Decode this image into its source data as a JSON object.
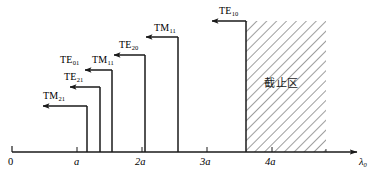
{
  "figure": {
    "title": "",
    "axis": {
      "name_symbol": "λ",
      "name_subscript": "0",
      "ticks": [
        {
          "label": "0",
          "italic": false,
          "x_units": 0
        },
        {
          "label": "a",
          "italic": true,
          "x_units": 1
        },
        {
          "label": "2a",
          "italic": true,
          "x_units": 2
        },
        {
          "label": "3a",
          "italic": true,
          "x_units": 3
        },
        {
          "label": "4a",
          "italic": true,
          "x_units": 4
        }
      ]
    },
    "region": {
      "label": "截止区",
      "start_units": 3.6,
      "end_units": 4.83,
      "hatch_color": "#4d4d4d",
      "fill_color": "#ffffff"
    },
    "modes": [
      {
        "name": "TM",
        "subscript": "21",
        "label": "TM₂₁",
        "cutoff_units": 1.12,
        "arrow_y": 106
      },
      {
        "name": "TE",
        "subscript": "21",
        "label": "TE₂₁",
        "cutoff_units": 1.35,
        "arrow_y": 87
      },
      {
        "name": "TE",
        "subscript": "01",
        "label": "TE₀₁",
        "cutoff_units": 1.55,
        "arrow_y": 70
      },
      {
        "name": "TM",
        "subscript": "11",
        "label": "TM₁₁",
        "cutoff_units": 1.55,
        "arrow_y": 70
      },
      {
        "name": "TE",
        "subscript": "20",
        "label": "TE₂₀",
        "cutoff_units": 2.05,
        "arrow_y": 55
      },
      {
        "name": "TM",
        "subscript": "11",
        "label": "TM₁₁",
        "cutoff_units": 2.55,
        "arrow_y": 37
      },
      {
        "name": "TE",
        "subscript": "10",
        "label": "TE₁₀",
        "cutoff_units": 3.6,
        "arrow_y": 21
      }
    ],
    "labels": {
      "tm21": {
        "text": "TM",
        "sub": "21"
      },
      "te21": {
        "text": "TE",
        "sub": "21"
      },
      "te01": {
        "text": "TE",
        "sub": "01"
      },
      "tm11_low": {
        "text": "TM",
        "sub": "11"
      },
      "te20": {
        "text": "TE",
        "sub": "20"
      },
      "tm11_high": {
        "text": "TM",
        "sub": "11"
      },
      "te10": {
        "text": "TE",
        "sub": "10"
      }
    },
    "colors": {
      "line": "#1a1a1a",
      "axis": "#1a1a1a",
      "background": "#ffffff"
    }
  }
}
